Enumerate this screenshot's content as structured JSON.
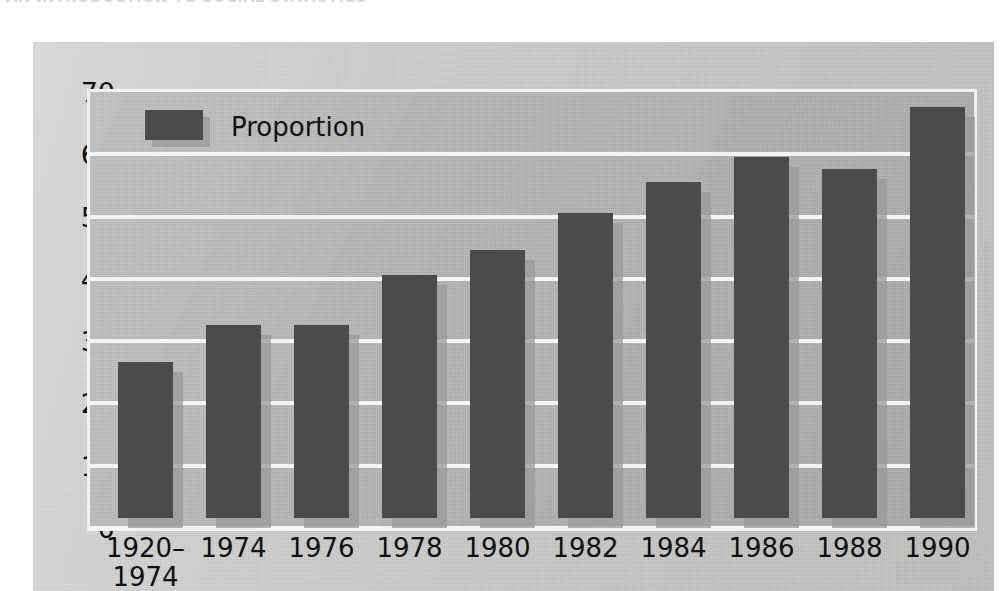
{
  "page": {
    "cut_off_heading": "AN INTRODUCTION TO SOCIAL STATISTICS"
  },
  "chart_data": {
    "type": "bar",
    "title": "",
    "xlabel": "",
    "ylabel": "%",
    "y_unit_label": "%",
    "categories": [
      "1920–\n1974",
      "1974",
      "1976",
      "1978",
      "1980",
      "1982",
      "1984",
      "1986",
      "1988",
      "1990"
    ],
    "values": [
      25,
      31,
      31,
      39,
      43,
      49,
      54,
      58,
      56,
      66
    ],
    "series": [
      {
        "name": "Proportion",
        "values": [
          25,
          31,
          31,
          39,
          43,
          49,
          54,
          58,
          56,
          66
        ]
      }
    ],
    "ylim": [
      0,
      70
    ],
    "yticks": [
      0,
      10,
      20,
      30,
      40,
      50,
      60,
      70
    ],
    "ytick_labels": [
      "0",
      "10",
      "20",
      "30",
      "40",
      "50",
      "60",
      "70"
    ],
    "grid": true,
    "legend": {
      "position": "top-left",
      "entries": [
        {
          "label": "Proportion",
          "color": "#4b4b4b"
        }
      ]
    },
    "colors": {
      "bar": "#4b4b4b",
      "bar_shadow": "#9a9a9a",
      "plot_background": "#b3b3b3",
      "panel_background": "#c9c9c9",
      "gridline": "#f4f4f4",
      "text": "#111111"
    }
  }
}
